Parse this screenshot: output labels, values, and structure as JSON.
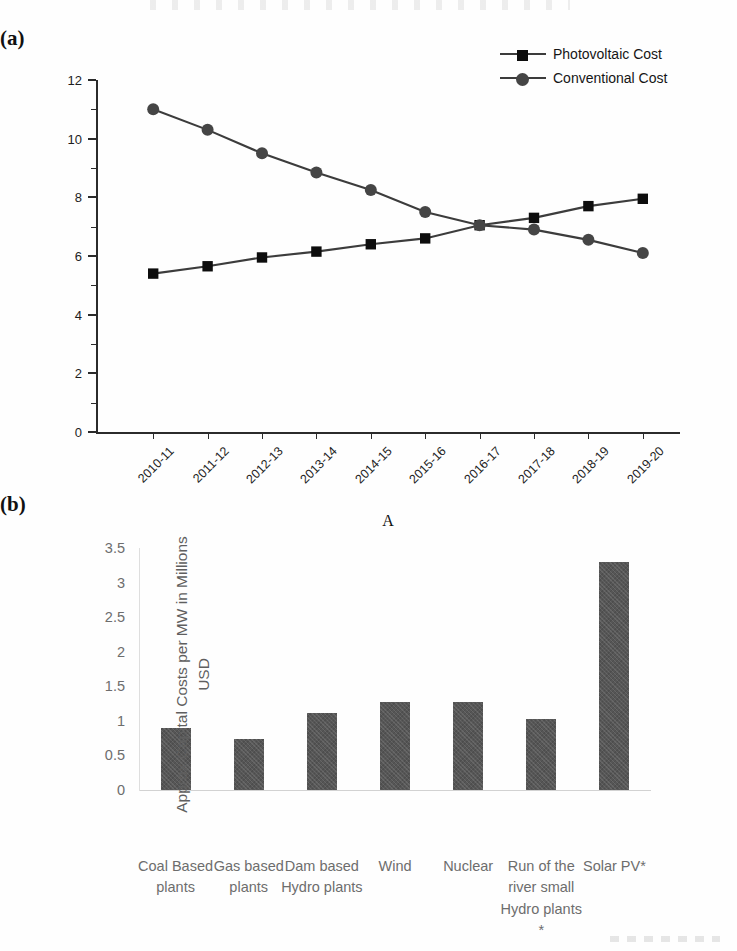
{
  "figure": {
    "panel_a_letter": "(a)",
    "panel_b_letter": "(b)"
  },
  "chart_data": [
    {
      "type": "line",
      "panel": "(a)",
      "title": "",
      "xlabel": "A",
      "ylabel": "",
      "categories": [
        "2010-11",
        "2011-12",
        "2012-13",
        "2013-14",
        "2014-15",
        "2015-16",
        "2016-17",
        "2017-18",
        "2018-19",
        "2019-20"
      ],
      "ylim": [
        0,
        12
      ],
      "yticks": [
        0,
        2,
        4,
        6,
        8,
        10,
        12
      ],
      "yticks_minor": [
        1,
        3,
        5,
        7,
        9,
        11
      ],
      "grid": false,
      "legend_position": "top-right",
      "series": [
        {
          "name": "Photovoltaic Cost",
          "marker": "square",
          "color": "#0d0d0d",
          "values": [
            5.4,
            5.65,
            5.95,
            6.15,
            6.4,
            6.6,
            7.05,
            7.3,
            7.7,
            7.95
          ]
        },
        {
          "name": "Conventional Cost",
          "marker": "circle",
          "color": "#454545",
          "values": [
            11.0,
            10.3,
            9.5,
            8.85,
            8.25,
            7.5,
            7.05,
            6.9,
            6.55,
            6.1
          ]
        }
      ]
    },
    {
      "type": "bar",
      "panel": "(b)",
      "title": "",
      "xlabel": "",
      "ylabel": "Approx Capital Costs per MW in Millions USD",
      "categories": [
        "Coal Based plants",
        "Gas based plants",
        "Dam based Hydro plants",
        "Wind",
        "Nuclear",
        "Run of the river small Hydro plants *",
        "Solar PV*"
      ],
      "values": [
        0.89,
        0.74,
        1.12,
        1.28,
        1.28,
        1.02,
        3.3
      ],
      "ylim": [
        0,
        3.5
      ],
      "yticks": [
        0,
        0.5,
        1,
        1.5,
        2,
        2.5,
        3,
        3.5
      ],
      "ytick_labels": [
        "0",
        "0.5",
        "1",
        "1.5",
        "2",
        "2.5",
        "3",
        "3.5"
      ],
      "grid": false,
      "bar_color": "#565656"
    }
  ]
}
